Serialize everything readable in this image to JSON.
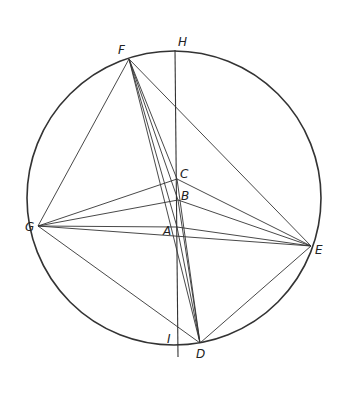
{
  "diagram": {
    "line_color": "#333333",
    "background": "#ffffff",
    "points": {
      "F": {
        "label": "F"
      },
      "G": {
        "label": "G"
      },
      "E": {
        "label": "E"
      },
      "D": {
        "label": "D"
      },
      "H": {
        "label": "H"
      },
      "I": {
        "label": "I"
      },
      "C": {
        "label": "C"
      },
      "B": {
        "label": "B"
      },
      "A": {
        "label": "A"
      }
    },
    "segments": [
      [
        "F",
        "G"
      ],
      [
        "F",
        "E"
      ],
      [
        "F",
        "D"
      ],
      [
        "F",
        "C"
      ],
      [
        "F",
        "B"
      ],
      [
        "F",
        "A"
      ],
      [
        "G",
        "C"
      ],
      [
        "G",
        "B"
      ],
      [
        "G",
        "A"
      ],
      [
        "G",
        "E"
      ],
      [
        "G",
        "D"
      ],
      [
        "E",
        "C"
      ],
      [
        "E",
        "B"
      ],
      [
        "E",
        "A"
      ],
      [
        "E",
        "D"
      ],
      [
        "C",
        "D"
      ],
      [
        "B",
        "D"
      ],
      [
        "A",
        "D"
      ],
      [
        "H",
        "I"
      ]
    ]
  }
}
